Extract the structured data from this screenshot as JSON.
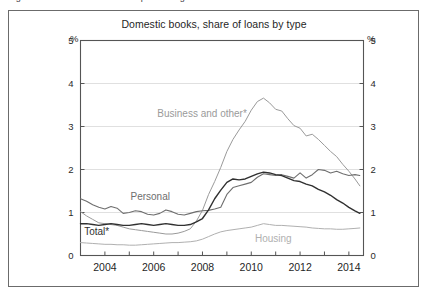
{
  "figure": {
    "caption_clipped": "Figure 2.11  Banks' share of non-performing loans on loan books",
    "border_color": "#6b6b6b"
  },
  "chart_data": {
    "type": "line",
    "title": "Domestic books, share of loans by type",
    "xlabel": "",
    "ylabel": "%",
    "ylabel_right": "%",
    "xlim": [
      2003.0,
      2014.6
    ],
    "ylim": [
      0,
      5
    ],
    "yticks": [
      0,
      1,
      2,
      3,
      4,
      5
    ],
    "ytick_labels": [
      "0",
      "1",
      "2",
      "3",
      "4",
      "5"
    ],
    "xticks": [
      2004,
      2005,
      2006,
      2007,
      2008,
      2009,
      2010,
      2011,
      2012,
      2013,
      2014
    ],
    "xtick_labels_major": [
      "2004",
      "2006",
      "2008",
      "2010",
      "2012",
      "2014"
    ],
    "xticks_major": [
      2004,
      2006,
      2008,
      2010,
      2012,
      2014
    ],
    "grid": "horizontal",
    "grid_color": "#d8d8d8",
    "legend_position": "inline-annotations",
    "series": [
      {
        "name": "Business and other*",
        "label": "Business and other*",
        "color": "#9a9a9a",
        "width": 1.0,
        "label_x": 2006.15,
        "label_y": 3.22,
        "x": [
          2003.0,
          2003.25,
          2003.5,
          2003.75,
          2004.0,
          2004.25,
          2004.5,
          2004.75,
          2005.0,
          2005.25,
          2005.5,
          2005.75,
          2006.0,
          2006.25,
          2006.5,
          2006.75,
          2007.0,
          2007.25,
          2007.5,
          2007.75,
          2008.0,
          2008.25,
          2008.5,
          2008.75,
          2009.0,
          2009.25,
          2009.5,
          2009.75,
          2010.0,
          2010.25,
          2010.5,
          2010.75,
          2011.0,
          2011.25,
          2011.5,
          2011.75,
          2012.0,
          2012.25,
          2012.5,
          2012.75,
          2013.0,
          2013.25,
          2013.5,
          2013.75,
          2014.0,
          2014.25,
          2014.45
        ],
        "y": [
          1.02,
          0.92,
          0.84,
          0.76,
          0.74,
          0.72,
          0.7,
          0.66,
          0.62,
          0.6,
          0.58,
          0.56,
          0.54,
          0.52,
          0.5,
          0.5,
          0.52,
          0.56,
          0.62,
          0.8,
          1.05,
          1.42,
          1.72,
          2.05,
          2.42,
          2.7,
          2.92,
          3.12,
          3.38,
          3.58,
          3.66,
          3.55,
          3.4,
          3.36,
          3.18,
          3.02,
          2.96,
          2.78,
          2.82,
          2.7,
          2.56,
          2.42,
          2.3,
          2.12,
          1.96,
          1.78,
          1.62
        ]
      },
      {
        "name": "Personal",
        "label": "Personal",
        "color": "#6e6e6e",
        "width": 1.1,
        "label_x": 2005.05,
        "label_y": 1.3,
        "x": [
          2003.0,
          2003.25,
          2003.5,
          2003.75,
          2004.0,
          2004.25,
          2004.5,
          2004.75,
          2005.0,
          2005.25,
          2005.5,
          2005.75,
          2006.0,
          2006.25,
          2006.5,
          2006.75,
          2007.0,
          2007.25,
          2007.5,
          2007.75,
          2008.0,
          2008.25,
          2008.5,
          2008.75,
          2009.0,
          2009.25,
          2009.5,
          2009.75,
          2010.0,
          2010.25,
          2010.5,
          2010.75,
          2011.0,
          2011.25,
          2011.5,
          2011.75,
          2012.0,
          2012.25,
          2012.5,
          2012.75,
          2013.0,
          2013.25,
          2013.5,
          2013.75,
          2014.0,
          2014.25,
          2014.45
        ],
        "y": [
          1.32,
          1.26,
          1.18,
          1.12,
          1.08,
          1.14,
          1.1,
          0.98,
          1.0,
          1.04,
          1.02,
          0.96,
          0.94,
          0.98,
          1.06,
          1.02,
          0.96,
          0.94,
          0.98,
          1.02,
          1.04,
          1.05,
          1.08,
          1.12,
          1.42,
          1.58,
          1.62,
          1.66,
          1.7,
          1.82,
          1.9,
          1.88,
          1.86,
          1.88,
          1.84,
          1.8,
          1.92,
          1.8,
          1.88,
          2.0,
          1.98,
          1.92,
          1.96,
          1.9,
          1.86,
          1.88,
          1.86
        ]
      },
      {
        "name": "Total*",
        "label": "Total*",
        "color": "#303030",
        "width": 1.4,
        "label_x": 2003.15,
        "label_y": 0.48,
        "x": [
          2003.0,
          2003.25,
          2003.5,
          2003.75,
          2004.0,
          2004.25,
          2004.5,
          2004.75,
          2005.0,
          2005.25,
          2005.5,
          2005.75,
          2006.0,
          2006.25,
          2006.5,
          2006.75,
          2007.0,
          2007.25,
          2007.5,
          2007.75,
          2008.0,
          2008.25,
          2008.5,
          2008.75,
          2009.0,
          2009.25,
          2009.5,
          2009.75,
          2010.0,
          2010.25,
          2010.5,
          2010.75,
          2011.0,
          2011.25,
          2011.5,
          2011.75,
          2012.0,
          2012.25,
          2012.5,
          2012.75,
          2013.0,
          2013.25,
          2013.5,
          2013.75,
          2014.0,
          2014.25,
          2014.45
        ],
        "y": [
          0.74,
          0.74,
          0.72,
          0.7,
          0.72,
          0.74,
          0.72,
          0.7,
          0.7,
          0.72,
          0.74,
          0.72,
          0.7,
          0.72,
          0.74,
          0.72,
          0.7,
          0.7,
          0.72,
          0.78,
          0.86,
          1.06,
          1.32,
          1.52,
          1.7,
          1.78,
          1.76,
          1.78,
          1.84,
          1.9,
          1.94,
          1.92,
          1.88,
          1.86,
          1.8,
          1.74,
          1.72,
          1.66,
          1.62,
          1.54,
          1.48,
          1.4,
          1.3,
          1.22,
          1.12,
          1.04,
          0.98
        ]
      },
      {
        "name": "Housing",
        "label": "Housing",
        "color": "#b0b0b0",
        "width": 1.0,
        "label_x": 2010.15,
        "label_y": 0.32,
        "x": [
          2003.0,
          2003.25,
          2003.5,
          2003.75,
          2004.0,
          2004.25,
          2004.5,
          2004.75,
          2005.0,
          2005.25,
          2005.5,
          2005.75,
          2006.0,
          2006.25,
          2006.5,
          2006.75,
          2007.0,
          2007.25,
          2007.5,
          2007.75,
          2008.0,
          2008.25,
          2008.5,
          2008.75,
          2009.0,
          2009.25,
          2009.5,
          2009.75,
          2010.0,
          2010.25,
          2010.5,
          2010.75,
          2011.0,
          2011.25,
          2011.5,
          2011.75,
          2012.0,
          2012.25,
          2012.5,
          2012.75,
          2013.0,
          2013.25,
          2013.5,
          2013.75,
          2014.0,
          2014.25,
          2014.45
        ],
        "y": [
          0.3,
          0.29,
          0.28,
          0.27,
          0.26,
          0.26,
          0.25,
          0.25,
          0.24,
          0.24,
          0.25,
          0.26,
          0.27,
          0.28,
          0.29,
          0.3,
          0.3,
          0.31,
          0.32,
          0.34,
          0.38,
          0.44,
          0.5,
          0.55,
          0.58,
          0.6,
          0.62,
          0.64,
          0.66,
          0.7,
          0.74,
          0.72,
          0.7,
          0.7,
          0.69,
          0.68,
          0.67,
          0.66,
          0.64,
          0.63,
          0.62,
          0.62,
          0.61,
          0.61,
          0.62,
          0.63,
          0.64
        ]
      }
    ]
  }
}
